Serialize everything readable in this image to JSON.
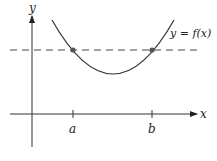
{
  "diagram": {
    "axes": {
      "x_label": "x",
      "y_label": "y"
    },
    "curve_label": "y = f(x)",
    "tick_labels": {
      "a": "a",
      "b": "b"
    },
    "dashed_line": "horizontal level line intersecting curve at x=a and x=b",
    "colors": {
      "stroke": "#333333",
      "point": "#555555",
      "background": "#ffffff"
    }
  }
}
